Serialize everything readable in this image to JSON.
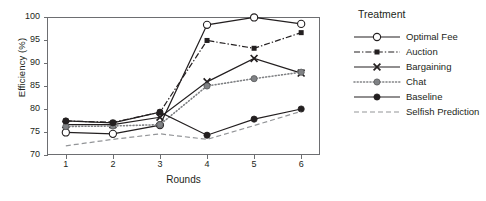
{
  "chart_data": {
    "type": "line",
    "title": "",
    "xlabel": "Rounds",
    "ylabel": "Efficiency (%)",
    "x": [
      1,
      2,
      3,
      4,
      5,
      6
    ],
    "xticklabels": [
      "1",
      "2",
      "3",
      "4",
      "5",
      "6"
    ],
    "yticklabels": [
      "70",
      "75",
      "80",
      "85",
      "90",
      "95",
      "100"
    ],
    "ylim": [
      70,
      100
    ],
    "xlim": [
      0.6,
      6.4
    ],
    "grid": false,
    "legend_position": "right",
    "legend_title": "Treatment",
    "series": [
      {
        "name": "Optimal Fee",
        "values": [
          74.9,
          74.6,
          76.5,
          98.3,
          99.9,
          98.5
        ],
        "marker": "open-circle",
        "linestyle": "solid",
        "color": "#231f20"
      },
      {
        "name": "Auction",
        "values": [
          77.4,
          77.1,
          79.3,
          94.9,
          93.2,
          96.6
        ],
        "marker": "filled-square",
        "linestyle": "dash-dot",
        "color": "#231f20"
      },
      {
        "name": "Bargaining",
        "values": [
          76.6,
          76.6,
          78.2,
          85.9,
          91.0,
          87.8
        ],
        "marker": "cross-x",
        "linestyle": "solid",
        "color": "#231f20"
      },
      {
        "name": "Chat",
        "values": [
          76.2,
          76.3,
          76.6,
          85.0,
          86.6,
          88.0
        ],
        "marker": "filled-circle-gray",
        "linestyle": "dotted",
        "color": "#808285"
      },
      {
        "name": "Baseline",
        "values": [
          77.4,
          77.0,
          79.3,
          74.3,
          77.8,
          80.0
        ],
        "marker": "filled-circle",
        "linestyle": "solid",
        "color": "#231f20"
      },
      {
        "name": "Selfish Prediction",
        "values": [
          72.0,
          73.4,
          74.6,
          73.4,
          76.4,
          79.5
        ],
        "marker": "none",
        "linestyle": "dashed",
        "color": "#939598"
      }
    ]
  },
  "axis_colors": {
    "frame": "#6d6e71",
    "text": "#231f20"
  }
}
